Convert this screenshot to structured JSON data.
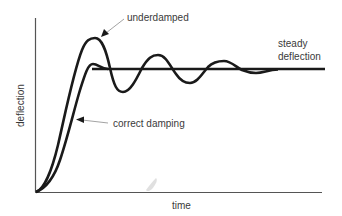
{
  "diagram": {
    "type": "damping-response-curves",
    "x_axis_label": "time",
    "y_axis_label": "deflection",
    "labels": {
      "underdamped": "underdamped",
      "correct_damping": "correct damping",
      "steady_line1": "steady",
      "steady_line2": "deflection"
    },
    "colors": {
      "curve": "#1a1a1a",
      "axis": "#555555",
      "text": "#3a3a3a",
      "arrow_line": "#999999",
      "smudge": "#d8d8d8"
    },
    "curves": [
      {
        "name": "underdamped",
        "description": "Overshoots to a peak then oscillates with decaying amplitude about the steady deflection"
      },
      {
        "name": "correct damping",
        "description": "Rises smoothly to the steady deflection with minimal overshoot"
      },
      {
        "name": "steady deflection",
        "description": "Horizontal line at final deflection value"
      }
    ]
  }
}
